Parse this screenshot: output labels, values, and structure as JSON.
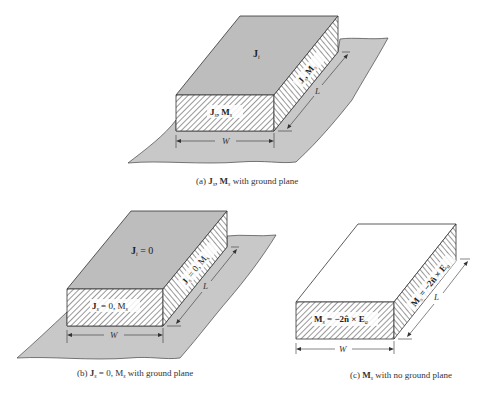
{
  "colors": {
    "ground_plane": "#c8c8c8",
    "box_top_shaded": "#bdbdbd",
    "box_top_plain": "#ffffff",
    "hatch_line": "#444444",
    "outline": "#333333",
    "label_bg": "#ffffff"
  },
  "panels": [
    {
      "id": "a",
      "caption_prefix": "(a) ",
      "caption_math": "J",
      "caption_sub1": "s",
      "caption_mid": ", M",
      "caption_sub2": "s",
      "caption_suffix": " with ground plane",
      "top_label": "J",
      "top_label_sub": "t",
      "top_label_suffix": "",
      "front_label": "J",
      "front_label_sub": "s",
      "front_label_mid": ", M",
      "front_label_sub2": "s",
      "side_label": "J",
      "side_label_sub": "s",
      "side_label_mid": ", M",
      "side_label_sub2": "s",
      "width_label": "W",
      "length_label": "L",
      "ground_plane": true
    },
    {
      "id": "b",
      "caption_prefix": "(b) ",
      "caption_math": "J",
      "caption_sub1": "s",
      "caption_mid": " = 0, M",
      "caption_sub2": "s",
      "caption_suffix": " with ground plane",
      "top_label": "J",
      "top_label_sub": "t",
      "top_label_suffix": " = 0",
      "front_label": "J",
      "front_label_sub": "s",
      "front_label_mid": " = 0, M",
      "front_label_sub2": "s",
      "side_label": "J",
      "side_label_sub": "s",
      "side_label_mid": " = 0, M",
      "side_label_sub2": "s",
      "width_label": "W",
      "length_label": "L",
      "ground_plane": true
    },
    {
      "id": "c",
      "caption_prefix": "(c) ",
      "caption_math": "M",
      "caption_sub1": "s",
      "caption_mid": "",
      "caption_sub2": "",
      "caption_suffix": " with no ground plane",
      "top_label": "",
      "top_label_sub": "",
      "top_label_suffix": "",
      "front_label": "M",
      "front_label_sub": "s",
      "front_label_mid": " = −2n̂ × E",
      "front_label_sub2": "a",
      "side_label": "M",
      "side_label_sub": "s",
      "side_label_mid": " = −2n̂ × E",
      "side_label_sub2": "a",
      "width_label": "W",
      "length_label": "L",
      "ground_plane": false
    }
  ]
}
